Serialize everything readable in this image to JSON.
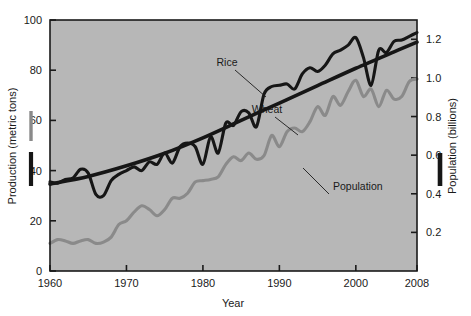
{
  "chart_data": {
    "type": "line",
    "title": "",
    "xlabel": "Year",
    "ylabel": "Production (metric tons)",
    "ylabel_right": "Population (billions)",
    "grid": false,
    "legend_position": "inline-annotations",
    "background_color": "#b7b7b7",
    "frame_color": "#1a1a1a",
    "xlim": [
      1960,
      2008
    ],
    "ylim": [
      0,
      100
    ],
    "ylim_right": [
      0,
      1.3
    ],
    "xticks": [
      1960,
      1970,
      1980,
      1990,
      2000,
      2008
    ],
    "xtick_labels": [
      "1960",
      "1970",
      "1980",
      "1990",
      "2000",
      "2008"
    ],
    "yticks": [
      0,
      20,
      40,
      60,
      80,
      100
    ],
    "ytick_labels": [
      "0",
      "20",
      "40",
      "60",
      "80",
      "100"
    ],
    "yticks_right": [
      0.2,
      0.4,
      0.6,
      0.8,
      1.0,
      1.2
    ],
    "ytick_labels_right": [
      "0.2",
      "0.4",
      "0.6",
      "0.8",
      "1.0",
      "1.2"
    ],
    "series": [
      {
        "name": "Rice",
        "color": "#161616",
        "width": 3.1,
        "axis": "left",
        "annotation": "Rice",
        "x": [
          1960,
          1961,
          1962,
          1963,
          1964,
          1965,
          1966,
          1967,
          1968,
          1969,
          1970,
          1971,
          1972,
          1973,
          1974,
          1975,
          1976,
          1977,
          1978,
          1979,
          1980,
          1981,
          1982,
          1983,
          1984,
          1985,
          1986,
          1987,
          1988,
          1989,
          1990,
          1991,
          1992,
          1993,
          1994,
          1995,
          1996,
          1997,
          1998,
          1999,
          2000,
          2001,
          2002,
          2003,
          2004,
          2005,
          2006,
          2007,
          2008
        ],
        "values": [
          35.5,
          35.0,
          36.5,
          37.0,
          40.5,
          39.0,
          30.5,
          30.0,
          36.0,
          38.5,
          40.0,
          41.5,
          40.0,
          43.5,
          42.5,
          47.0,
          43.0,
          49.5,
          51.0,
          49.5,
          42.5,
          53.5,
          47.0,
          59.0,
          58.0,
          63.5,
          63.0,
          57.5,
          70.5,
          73.5,
          74.0,
          74.5,
          72.5,
          78.5,
          81.0,
          79.5,
          82.0,
          86.5,
          88.0,
          90.0,
          93.0,
          85.0,
          74.0,
          88.0,
          87.0,
          91.5,
          92.0,
          93.5,
          95.0
        ]
      },
      {
        "name": "Wheat",
        "color": "#8a8a8a",
        "width": 3.1,
        "axis": "left",
        "annotation": "Wheat",
        "x": [
          1960,
          1961,
          1962,
          1963,
          1964,
          1965,
          1966,
          1967,
          1968,
          1969,
          1970,
          1971,
          1972,
          1973,
          1974,
          1975,
          1976,
          1977,
          1978,
          1979,
          1980,
          1981,
          1982,
          1983,
          1984,
          1985,
          1986,
          1987,
          1988,
          1989,
          1990,
          1991,
          1992,
          1993,
          1994,
          1995,
          1996,
          1997,
          1998,
          1999,
          2000,
          2001,
          2002,
          2003,
          2004,
          2005,
          2006,
          2007,
          2008
        ],
        "values": [
          11.0,
          12.5,
          12.0,
          11.0,
          12.0,
          12.5,
          11.0,
          11.5,
          13.5,
          18.5,
          20.0,
          23.5,
          26.0,
          24.5,
          22.0,
          24.5,
          29.0,
          29.0,
          31.0,
          35.5,
          36.0,
          36.5,
          37.5,
          42.5,
          45.5,
          44.0,
          47.0,
          44.5,
          46.0,
          54.0,
          49.5,
          55.5,
          57.0,
          55.5,
          59.5,
          65.5,
          62.0,
          69.5,
          66.0,
          71.5,
          76.0,
          69.5,
          72.5,
          65.5,
          72.0,
          68.5,
          69.5,
          75.5,
          76.5
        ]
      },
      {
        "name": "Population",
        "color": "#161616",
        "width": 3.6,
        "axis": "right",
        "annotation": "Population",
        "x": [
          1960,
          1965,
          1970,
          1975,
          1980,
          1985,
          1990,
          1995,
          2000,
          2005,
          2008
        ],
        "values": [
          0.45,
          0.49,
          0.545,
          0.61,
          0.69,
          0.78,
          0.87,
          0.96,
          1.05,
          1.135,
          1.185
        ]
      }
    ],
    "annotations": [
      {
        "text": "Rice",
        "label_x": 227,
        "label_y": 66,
        "line_to_x": 266,
        "line_to_y": 97
      },
      {
        "text": "Wheat",
        "label_x": 267,
        "label_y": 113,
        "line_to_x": 298,
        "line_to_y": 135
      },
      {
        "text": "Population",
        "label_x": 333,
        "label_y": 190,
        "line_to_x": 303,
        "line_to_y": 168
      }
    ],
    "legend_keys": [
      {
        "for": "Wheat",
        "color": "#8a8a8a",
        "side": "left"
      },
      {
        "for": "Rice",
        "color": "#161616",
        "side": "left"
      },
      {
        "for": "Population",
        "color": "#161616",
        "side": "right"
      }
    ]
  }
}
